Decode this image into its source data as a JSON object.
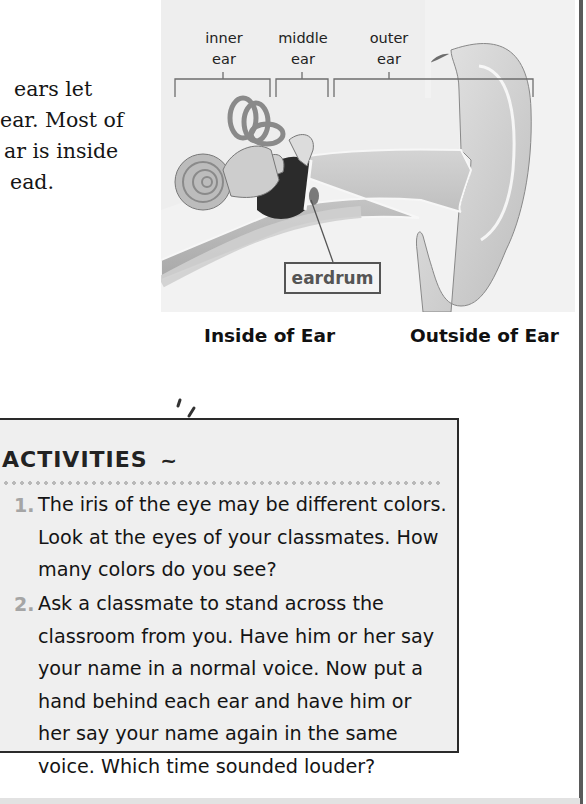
{
  "intro_text": {
    "lines": [
      "ears let",
      "ear. Most of",
      "ar is inside",
      "ead."
    ]
  },
  "diagram": {
    "labels": {
      "inner_ear": [
        "inner",
        "ear"
      ],
      "middle_ear": [
        "middle",
        "ear"
      ],
      "outer_ear": [
        "outer",
        "ear"
      ],
      "eardrum": "eardrum"
    },
    "captions": {
      "inside": "Inside of Ear",
      "outside": "Outside of Ear"
    }
  },
  "activities": {
    "title": "ACTIVITIES",
    "items": [
      {
        "number": "1.",
        "lines": [
          "The iris of the eye may be different colors.",
          "Look at the eyes of your classmates. How",
          "many colors do you see?"
        ]
      },
      {
        "number": "2.",
        "lines": [
          "Ask a classmate to stand across the",
          "classroom from you. Have him or her say",
          "your name in a normal voice. Now put a",
          "hand behind each ear and have him or",
          "her say your name again in the same",
          "voice. Which time sounded louder?"
        ]
      }
    ]
  }
}
